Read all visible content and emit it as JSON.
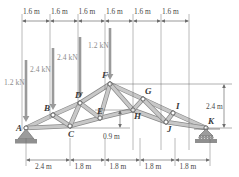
{
  "figure": {
    "kind": "howe-truss-free-body-diagram",
    "joints": [
      {
        "id": "A",
        "label": "A",
        "x": 26,
        "y": 128
      },
      {
        "id": "B",
        "label": "B",
        "x": 53,
        "y": 115
      },
      {
        "id": "C",
        "label": "C",
        "x": 70,
        "y": 126
      },
      {
        "id": "D",
        "label": "D",
        "x": 80,
        "y": 103
      },
      {
        "id": "E",
        "label": "E",
        "x": 100,
        "y": 118
      },
      {
        "id": "F",
        "label": "F",
        "x": 110,
        "y": 84
      },
      {
        "id": "G",
        "label": "G",
        "x": 143,
        "y": 99
      },
      {
        "id": "H",
        "label": "H",
        "x": 133,
        "y": 110
      },
      {
        "id": "I",
        "label": "I",
        "x": 173,
        "y": 113
      },
      {
        "id": "J",
        "label": "J",
        "x": 166,
        "y": 122
      },
      {
        "id": "K",
        "label": "K",
        "x": 206,
        "y": 128
      }
    ],
    "members": [
      [
        "A",
        "B"
      ],
      [
        "B",
        "D"
      ],
      [
        "D",
        "F"
      ],
      [
        "F",
        "G"
      ],
      [
        "G",
        "I"
      ],
      [
        "I",
        "K"
      ],
      [
        "A",
        "C"
      ],
      [
        "C",
        "E"
      ],
      [
        "E",
        "H"
      ],
      [
        "H",
        "J"
      ],
      [
        "J",
        "K"
      ],
      [
        "B",
        "C"
      ],
      [
        "D",
        "C"
      ],
      [
        "D",
        "E"
      ],
      [
        "F",
        "E"
      ],
      [
        "F",
        "H"
      ],
      [
        "G",
        "H"
      ],
      [
        "G",
        "J"
      ],
      [
        "I",
        "J"
      ]
    ],
    "supports": [
      {
        "at": "A",
        "type": "pin"
      },
      {
        "at": "K",
        "type": "roller"
      }
    ],
    "loads": [
      {
        "label": "1.2 kN",
        "value": 1.2,
        "unit": "kN",
        "at_x": 26,
        "arrow_top": 60,
        "arrow_bottom": 122,
        "text_x": 4,
        "text_y": 79
      },
      {
        "label": "2.4 kN",
        "value": 2.4,
        "unit": "kN",
        "at_x": 53,
        "arrow_top": 48,
        "arrow_bottom": 110,
        "text_x": 30,
        "text_y": 66
      },
      {
        "label": "2.4 kN",
        "value": 2.4,
        "unit": "kN",
        "at_x": 80,
        "arrow_top": 37,
        "arrow_bottom": 98,
        "text_x": 57,
        "text_y": 54
      },
      {
        "label": "1.2 kN",
        "value": 1.2,
        "unit": "kN",
        "at_x": 110,
        "arrow_top": 28,
        "arrow_bottom": 80,
        "text_x": 88,
        "text_y": 42
      }
    ],
    "top_dimensions": {
      "axis_y": 21,
      "ticks": [
        22,
        50,
        78,
        105,
        133,
        161,
        189
      ],
      "labels": [
        "1.6 m",
        "1.6 m",
        "1.6 m",
        "1.6 m",
        "1.6 m",
        "1.6 m"
      ],
      "label_y": 8
    },
    "bottom_dimensions": {
      "axis_y": 160,
      "ticks": [
        26,
        70,
        105,
        140,
        175,
        210
      ],
      "labels": [
        "2.4 m",
        "1.8 m",
        "1.8 m",
        "1.8 m",
        "1.8 m"
      ],
      "label_y": 163
    },
    "right_dimension": {
      "label": "2.4 m",
      "top_y": 84,
      "bottom_y": 128,
      "x": 224,
      "label_x": 206,
      "label_y": 103
    },
    "inner_dimension": {
      "label": "0.9 m",
      "top_y": 110,
      "bottom_y": 128,
      "x": 120,
      "label_x": 103,
      "label_y": 133
    }
  },
  "colors": {
    "member_fill": "#c8c8c8",
    "member_stroke": "#8a8a8a",
    "joint_fill": "#ffffff",
    "joint_stroke": "#5a5a5a",
    "load_arrow": "#9a9a9a",
    "dimension_line": "#6e6e6e",
    "support_fill": "#9c9c9c",
    "label_text": "#3a3a3a",
    "background": "#ffffff"
  }
}
